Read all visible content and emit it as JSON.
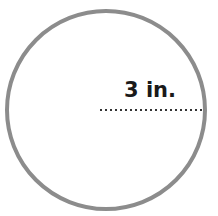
{
  "diagram": {
    "shape": "circle",
    "radius_label": "3 in.",
    "colors": {
      "circle_stroke": "#8c8c8c",
      "radius_line": "#333333",
      "label": "#1a1a1a",
      "background": "#ffffff"
    }
  }
}
